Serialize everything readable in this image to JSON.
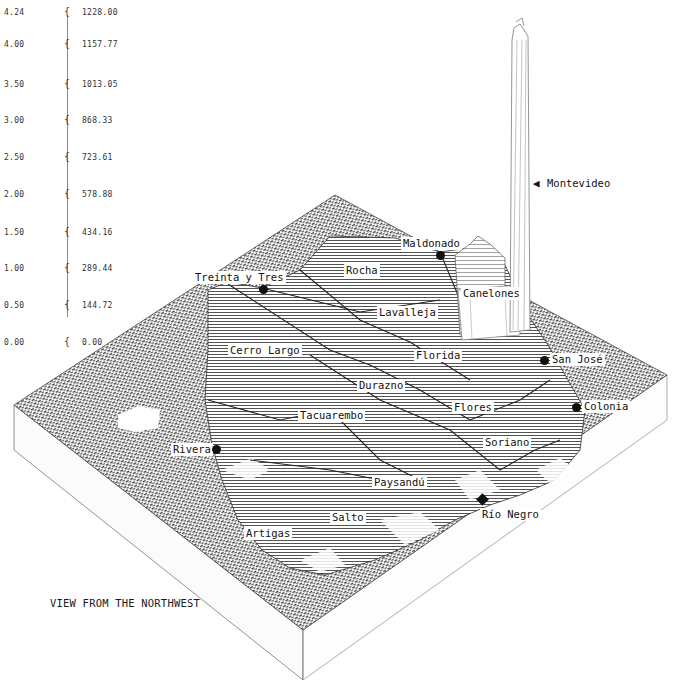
{
  "chart_data": {
    "type": "3d-surface",
    "title": "",
    "view_caption": "VIEW FROM THE NORTHWEST",
    "scale": {
      "left_ticks": [
        "4.24",
        "4.00",
        "3.50",
        "3.00",
        "2.50",
        "2.00",
        "1.50",
        "1.00",
        "0.50",
        "0.00"
      ],
      "right_ticks": [
        "1228.00",
        "1157.77",
        "1013.05",
        "868.33",
        "723.61",
        "578.88",
        "434.16",
        "289.44",
        "144.72",
        "0.00"
      ],
      "left_values": [
        4.24,
        4.0,
        3.5,
        3.0,
        2.5,
        2.0,
        1.5,
        1.0,
        0.5,
        0.0
      ],
      "right_values": [
        1228.0,
        1157.77,
        1013.05,
        868.33,
        723.61,
        578.88,
        434.16,
        289.44,
        144.72,
        0.0
      ]
    },
    "departments": [
      {
        "name": "Montevideo",
        "relative_height": "max"
      },
      {
        "name": "Canelones",
        "relative_height": "high"
      },
      {
        "name": "Maldonado",
        "relative_height": "medium"
      },
      {
        "name": "Rocha",
        "relative_height": "low"
      },
      {
        "name": "Treinta y Tres",
        "relative_height": "low"
      },
      {
        "name": "Lavalleja",
        "relative_height": "low"
      },
      {
        "name": "Cerro Largo",
        "relative_height": "low"
      },
      {
        "name": "Florida",
        "relative_height": "low"
      },
      {
        "name": "San José",
        "relative_height": "medium"
      },
      {
        "name": "Durazno",
        "relative_height": "low"
      },
      {
        "name": "Flores",
        "relative_height": "low"
      },
      {
        "name": "Colonia",
        "relative_height": "medium"
      },
      {
        "name": "Tacuarembo",
        "relative_height": "low"
      },
      {
        "name": "Soriano",
        "relative_height": "low"
      },
      {
        "name": "Rivera",
        "relative_height": "low"
      },
      {
        "name": "Paysandú",
        "relative_height": "low"
      },
      {
        "name": "Río Negro",
        "relative_height": "low"
      },
      {
        "name": "Salto",
        "relative_height": "low"
      },
      {
        "name": "Artigas",
        "relative_height": "low"
      }
    ],
    "grid": false,
    "legend": "none"
  },
  "labels": {
    "montevideo": "Montevideo",
    "canelones": "Canelones",
    "maldonado": "Maldonado",
    "rocha": "Rocha",
    "treinta": "Treinta y Tres",
    "lavalleja": "Lavalleja",
    "cerro_largo": "Cerro Largo",
    "florida": "Florida",
    "san_jose": "San José",
    "durazno": "Durazno",
    "flores": "Flores",
    "colonia": "Colonia",
    "tacuarembo": "Tacuarembo",
    "soriano": "Soriano",
    "rivera": "Rivera",
    "paysandu": "Paysandú",
    "rio_negro": "Río Negro",
    "salto": "Salto",
    "artigas": "Artigas"
  },
  "caption": "VIEW FROM THE NORTHWEST",
  "brace_glyph": "{",
  "colors": {
    "ink": "#1a1a1a",
    "hatch": "#555555",
    "paper": "#ffffff"
  }
}
